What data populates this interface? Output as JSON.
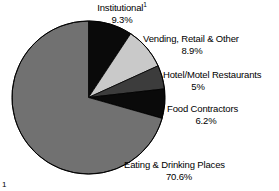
{
  "chart_data": {
    "type": "pie",
    "title": "",
    "subtitle": "",
    "xlabel": "",
    "ylabel": "",
    "legend_position": "none",
    "grid": false,
    "start_angle_deg": 0,
    "direction": "clockwise",
    "categories": [
      "Institutional",
      "Vending, Retail & Other",
      "Hotel/Motel Restaurants",
      "Food Contractors",
      "Eating & Drinking Places"
    ],
    "values": [
      9.3,
      8.9,
      5,
      6.2,
      70.6
    ],
    "value_labels": [
      "9.3%",
      "8.9%",
      "5%",
      "6.2%",
      "70.6%"
    ],
    "colors": [
      "#0a0a0a",
      "#c9c9c9",
      "#3c3c3c",
      "#0a0a0a",
      "#717171"
    ],
    "slices": [
      {
        "name": "Institutional",
        "name_suffix": "1",
        "value": 9.3,
        "value_label": "9.3%",
        "color": "#0a0a0a"
      },
      {
        "name": "Vending, Retail & Other",
        "name_suffix": "",
        "value": 8.9,
        "value_label": "8.9%",
        "color": "#c9c9c9"
      },
      {
        "name": "Hotel/Motel Restaurants",
        "name_suffix": "",
        "value": 5,
        "value_label": "5%",
        "color": "#3c3c3c"
      },
      {
        "name": "Food Contractors",
        "name_suffix": "",
        "value": 6.2,
        "value_label": "6.2%",
        "color": "#0a0a0a"
      },
      {
        "name": "Eating & Drinking Places",
        "name_suffix": "",
        "value": 70.6,
        "value_label": "70.6%",
        "color": "#717171"
      }
    ]
  },
  "figure": {
    "background": "#ffffff",
    "outline_color": "#000000",
    "footnote_marker": "1"
  }
}
